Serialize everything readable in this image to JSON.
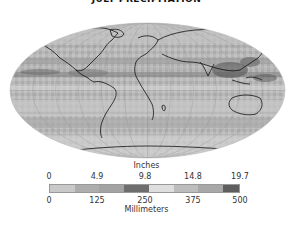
{
  "title": "JULY PRECIPITATION",
  "map": {
    "projection": "Mollweide",
    "description": "Global July precipitation map in grayscale"
  },
  "legend": {
    "top_label": "Inches",
    "bottom_label": "Millimeters",
    "inches_ticks": [
      "0",
      "4.9",
      "9.8",
      "14.8",
      "19.7"
    ],
    "mm_ticks": [
      "0",
      "125",
      "250",
      "375",
      "500"
    ],
    "segment_colors": [
      "#c9c9c9",
      "#adadad",
      "#a3a3a3",
      "#6e6e6e",
      "#dedede",
      "#bdbdbd",
      "#a8a8a8",
      "#5e5e5e"
    ]
  }
}
